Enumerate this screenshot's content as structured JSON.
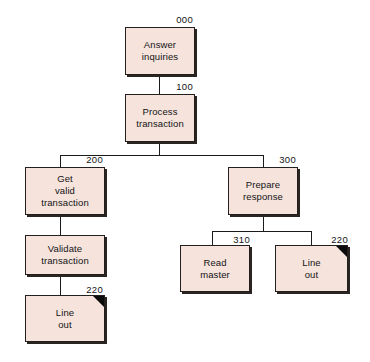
{
  "diagram": {
    "type": "hierarchical-structure-chart",
    "title": "",
    "background_color": "#ffffff",
    "node_fill_color": "#f5e3dc",
    "node_border_color": "#231f1e",
    "shadow_color": "#2b2522",
    "marker_color": "#0c0c0c",
    "nodes": [
      {
        "id": "answer-inquiries",
        "number": "000",
        "lines": [
          "Answer",
          "inquiries"
        ],
        "level": 0,
        "marker": false
      },
      {
        "id": "process-transaction",
        "number": "100",
        "lines": [
          "Process",
          "transaction"
        ],
        "level": 1,
        "marker": false
      },
      {
        "id": "get-valid-transaction",
        "number": "200",
        "lines": [
          "Get",
          "valid",
          "transaction"
        ],
        "level": 2,
        "marker": false
      },
      {
        "id": "prepare-response",
        "number": "300",
        "lines": [
          "Prepare",
          "response"
        ],
        "level": 2,
        "marker": false
      },
      {
        "id": "validate-transaction",
        "number": "210",
        "lines": [
          "Validate",
          "transaction"
        ],
        "level": 3,
        "marker": false
      },
      {
        "id": "line-out-left",
        "number": "220",
        "lines": [
          "Line",
          "out"
        ],
        "level": 4,
        "marker": true
      },
      {
        "id": "read-master",
        "number": "310",
        "lines": [
          "Read",
          "master"
        ],
        "level": 3,
        "marker": false
      },
      {
        "id": "line-out-right",
        "number": "220",
        "lines": [
          "Line",
          "out"
        ],
        "level": 3,
        "marker": true
      }
    ],
    "edges": [
      {
        "from": "answer-inquiries",
        "to": "process-transaction"
      },
      {
        "from": "process-transaction",
        "to": "get-valid-transaction"
      },
      {
        "from": "process-transaction",
        "to": "prepare-response"
      },
      {
        "from": "get-valid-transaction",
        "to": "validate-transaction"
      },
      {
        "from": "validate-transaction",
        "to": "line-out-left"
      },
      {
        "from": "prepare-response",
        "to": "read-master"
      },
      {
        "from": "prepare-response",
        "to": "line-out-right"
      }
    ]
  }
}
